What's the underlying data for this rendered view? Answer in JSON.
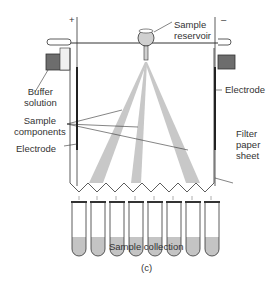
{
  "figure": {
    "panel_label": "(c)",
    "polarity": {
      "left": "+",
      "right": "–"
    },
    "labels": {
      "sample_reservoir": [
        "Sample",
        "reservoir"
      ],
      "buffer_solution": [
        "Buffer",
        "solution"
      ],
      "electrode_right": "Electrode",
      "sample_components": [
        "Sample",
        "components"
      ],
      "electrode_left": "Electrode",
      "filter_paper_sheet": [
        "Filter",
        "paper",
        "sheet"
      ],
      "sample_collection": "Sample collection"
    },
    "tube_count": 8,
    "colors": {
      "stream": "#c8c8c8",
      "liquid": "#c4c4c4",
      "line": "#333333",
      "buffer_box": "#6d6d6d"
    }
  }
}
